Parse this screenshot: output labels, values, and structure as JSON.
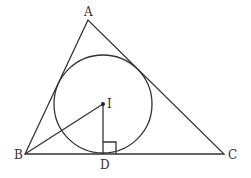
{
  "diagram": {
    "type": "geometry",
    "stroke_color": "#333333",
    "background": "#ffffff",
    "points": {
      "A": {
        "label": "A",
        "x": 88,
        "y": 20
      },
      "B": {
        "label": "B",
        "x": 25,
        "y": 154
      },
      "C": {
        "label": "C",
        "x": 224,
        "y": 154
      },
      "I": {
        "label": "I",
        "x": 103,
        "y": 104
      },
      "D": {
        "label": "D",
        "x": 103,
        "y": 154
      }
    },
    "incircle": {
      "center": "I",
      "radius": 49
    },
    "segments": [
      "AB",
      "BC",
      "CA",
      "IB",
      "ID"
    ],
    "right_angle_marker": {
      "at": "D",
      "size": 13
    }
  }
}
